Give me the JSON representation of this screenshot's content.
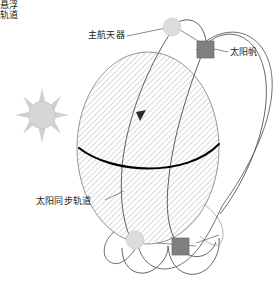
{
  "diagram": {
    "background_color": "#ffffff",
    "labels": {
      "main_spacecraft": "主航天器",
      "solar_sail": "太阳帆",
      "sun_synchronous_orbit": "太阳同步轨道",
      "hover_orbit_line1": "悬浮",
      "hover_orbit_line2": "轨道"
    },
    "colors": {
      "planet_outline": "#6b6b6b",
      "planet_hatch": "#b9b9b9",
      "equator": "#000000",
      "orbit_line": "#555555",
      "sun_fill": "#d6d6d6",
      "sun_ray": "#d0d0d0",
      "spacecraft_circle": "#dcdcdc",
      "solar_sail_square": "#7f7f7f",
      "leader_line": "#6d6d6d",
      "text": "#1a1a1a"
    },
    "icons": {
      "sun": "sun-icon",
      "main_spacecraft_marker": "circle-marker-icon",
      "solar_sail_marker": "square-marker-icon",
      "direction_arrow": "arrowhead-icon"
    },
    "elements": {
      "planet_label": "hatched-sphere",
      "sun_ray_count": 8,
      "equator_label": "equator-line",
      "orbit_count": 4
    }
  }
}
